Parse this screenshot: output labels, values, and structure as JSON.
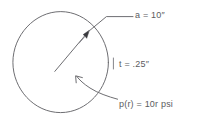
{
  "figure": {
    "ink_color": "#6e6e72",
    "text_color": "#5b5b60",
    "background_color": "#ffffff",
    "annotations": {
      "radius": "a = 10″",
      "thickness": "t = .25″",
      "pressure": "p(r) = 10r  psi"
    },
    "geometry": {
      "circle": {
        "cx": 60.5,
        "cy": 62,
        "r": 48
      },
      "radius_leader_start": {
        "x": 55,
        "y": 71
      },
      "radius_leader_tip": {
        "x": 88,
        "y": 32
      },
      "pressure_leader_tip": {
        "x": 76,
        "y": 84
      }
    },
    "icons": {
      "radius_arrow": "arrow-head-icon",
      "pressure_arrow": "curved-arrow-icon"
    }
  }
}
